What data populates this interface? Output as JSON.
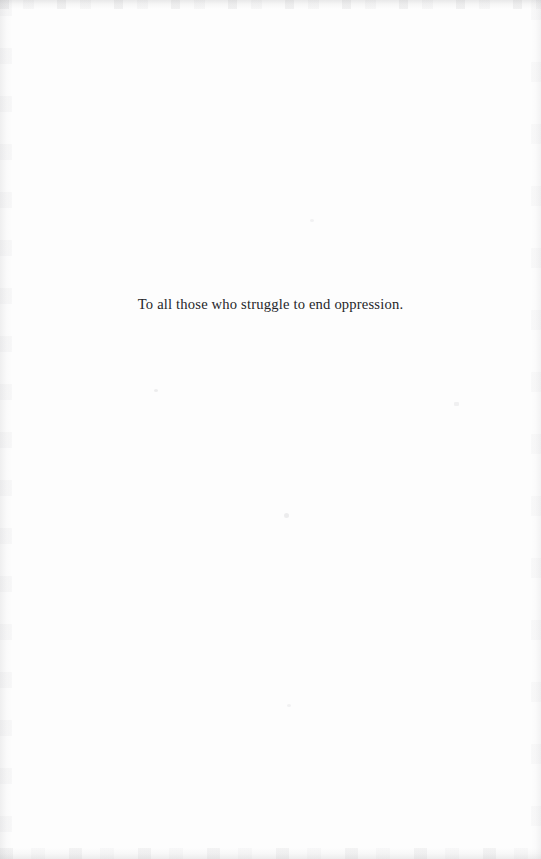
{
  "page": {
    "kind": "book-dedication-page",
    "background_color": "#fdfdfd",
    "text_color": "#26262a",
    "width": 541,
    "height": 859
  },
  "dedication": {
    "text": "To all those who struggle to end oppression."
  },
  "artifacts": {
    "top_edge": "",
    "bottom_edge": "",
    "left_edge": "",
    "right_edge": "",
    "speck_1": "",
    "speck_2": "",
    "speck_3": "",
    "speck_4": "",
    "speck_5": ""
  }
}
